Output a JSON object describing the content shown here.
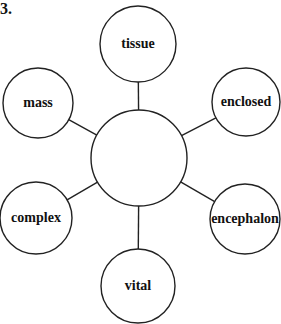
{
  "question_number": "3.",
  "diagram": {
    "type": "word-web",
    "center": {
      "label": "",
      "cx": 139,
      "cy": 158,
      "r": 48
    },
    "nodes": [
      {
        "label": "tissue",
        "cx": 138,
        "cy": 44,
        "r": 38
      },
      {
        "label": "enclosed",
        "cx": 246,
        "cy": 102,
        "r": 34
      },
      {
        "label": "encephalon",
        "cx": 245,
        "cy": 219,
        "r": 35
      },
      {
        "label": "vital",
        "cx": 138,
        "cy": 286,
        "r": 37
      },
      {
        "label": "complex",
        "cx": 36,
        "cy": 218,
        "r": 36
      },
      {
        "label": "mass",
        "cx": 38,
        "cy": 103,
        "r": 35
      }
    ]
  }
}
